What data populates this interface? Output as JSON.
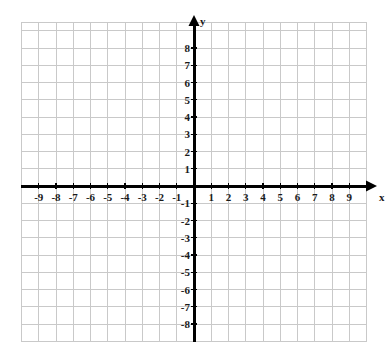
{
  "figure": {
    "title": "",
    "background_color": "#ffffff",
    "width": 392,
    "height": 362
  },
  "axis_labels": {
    "x_name": "x",
    "y_name": "y"
  },
  "style": {
    "grid_color": "#c9c9c9",
    "axis_color": "#000000",
    "label_color": "#1a1a1a",
    "grid_line_width": 1,
    "axis_line_width": 3
  },
  "chart_data": {
    "type": "scatter",
    "title": "",
    "xlabel": "x",
    "ylabel": "y",
    "grid": true,
    "legend": null,
    "series": [],
    "x": [],
    "y": [],
    "xlim": [
      -10,
      10
    ],
    "ylim": [
      -9,
      9.5
    ],
    "x_tick_labels": [
      "-9",
      "-8",
      "-7",
      "-6",
      "-5",
      "-4",
      "-3",
      "-2",
      "-1",
      "1",
      "2",
      "3",
      "4",
      "5",
      "6",
      "7",
      "8",
      "9"
    ],
    "x_tick_values": [
      -9,
      -8,
      -7,
      -6,
      -5,
      -4,
      -3,
      -2,
      -1,
      1,
      2,
      3,
      4,
      5,
      6,
      7,
      8,
      9
    ],
    "y_tick_labels": [
      "8",
      "7",
      "6",
      "5",
      "4",
      "3",
      "2",
      "1",
      "-1",
      "-2",
      "-3",
      "-4",
      "-5",
      "-6",
      "-7",
      "-8"
    ],
    "y_tick_values": [
      8,
      7,
      6,
      5,
      4,
      3,
      2,
      1,
      -1,
      -2,
      -3,
      -4,
      -5,
      -6,
      -7,
      -8
    ],
    "x_major_step": 1,
    "y_major_step": 1,
    "origin_label": "",
    "annotations": []
  },
  "geometry": {
    "origin_px": [
      194,
      186
    ],
    "cell_px": 17.25,
    "grid_left_px": 21,
    "grid_right_px": 366.5,
    "grid_top_px": 22,
    "grid_bottom_px": 341,
    "x_axis_start_px": 21,
    "x_axis_end_px": 377,
    "y_axis_start_px": 15,
    "y_axis_end_px": 342
  }
}
